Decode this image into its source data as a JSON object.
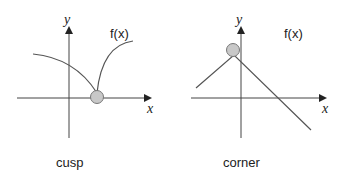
{
  "panels": [
    {
      "caption": "cusp",
      "function_label": "f(x)",
      "x_axis_label": "x",
      "y_axis_label": "y"
    },
    {
      "caption": "corner",
      "function_label": "f(x)",
      "x_axis_label": "x",
      "y_axis_label": "y"
    }
  ],
  "colors": {
    "line": "#555555",
    "marker_fill": "#c8c8c8",
    "marker_stroke": "#777777"
  }
}
